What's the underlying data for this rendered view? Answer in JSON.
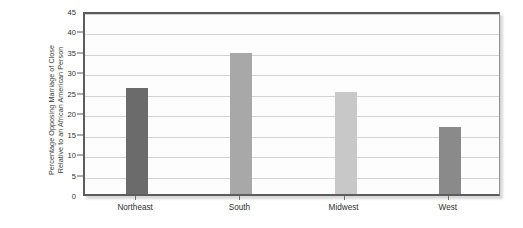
{
  "chart_data": {
    "type": "bar",
    "title": "",
    "subtitle": "",
    "xlabel": "",
    "ylabel": "Percentage Opposing Marriage of Close Relative to an African American Person",
    "ylabel_lines": [
      "Percentage Opposing Marriage of Close",
      "Relative to an African American Person"
    ],
    "categories": [
      "Northeast",
      "South",
      "Midwest",
      "West"
    ],
    "values": [
      26,
      34.5,
      25,
      16.5
    ],
    "bar_colors": [
      "#6b6b6b",
      "#a8a8a8",
      "#c8c8c8",
      "#8a8a8a"
    ],
    "ylim": [
      0,
      45
    ],
    "ytick_interval": 5,
    "yticks": [
      0,
      5,
      10,
      15,
      20,
      25,
      30,
      35,
      40,
      45
    ],
    "ytick_labels": [
      "0",
      "5",
      "10",
      "15",
      "20",
      "25",
      "30",
      "35",
      "40",
      "45"
    ],
    "grid": true,
    "grid_axis": "y",
    "legend": false,
    "legend_position": "none",
    "plot_background": "#fdfdfd",
    "grid_color": "#d2d2d2",
    "frame_color": "#5d5d5d"
  }
}
